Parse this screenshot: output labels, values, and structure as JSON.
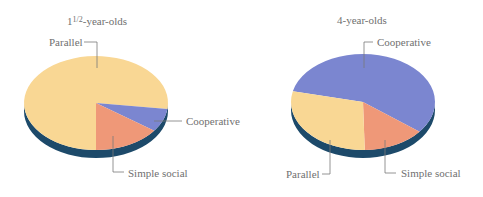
{
  "chart_data": [
    {
      "type": "pie",
      "title": "1½-year-olds",
      "categories": [
        "Parallel",
        "Cooperative",
        "Simple social"
      ],
      "values": [
        77,
        8,
        15
      ],
      "colors": [
        "#f9d794",
        "#7b86d0",
        "#ef9878"
      ],
      "style": "3d-tilted",
      "side_color": "#1d4a6a"
    },
    {
      "type": "pie",
      "title": "4-year-olds",
      "categories": [
        "Cooperative",
        "Simple social",
        "Parallel"
      ],
      "values": [
        57,
        14,
        29
      ],
      "colors": [
        "#7b86d0",
        "#ef9878",
        "#f9d794"
      ],
      "style": "3d-tilted",
      "side_color": "#1d4a6a"
    }
  ],
  "pies": {
    "left": {
      "title_main": "1",
      "title_frac": "1/2",
      "title_rest": "-year-olds",
      "labels": {
        "parallel": "Parallel",
        "cooperative": "Cooperative",
        "simple_social": "Simple social"
      }
    },
    "right": {
      "title": "4-year-olds",
      "labels": {
        "parallel": "Parallel",
        "cooperative": "Cooperative",
        "simple_social": "Simple social"
      }
    }
  },
  "colors": {
    "parallel": "#f9d794",
    "cooperative": "#7b86d0",
    "simple_social": "#ef9878",
    "side": "#1d4a6a",
    "leader": "#7a7a7a"
  }
}
